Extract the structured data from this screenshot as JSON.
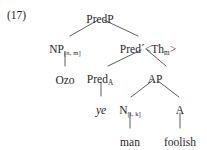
{
  "figure": {
    "example_number": "(17)",
    "type": "syntax-tree",
    "background_color": "#ffffff",
    "text_color": "#1f1f1f",
    "line_color": "#4a4a4a"
  },
  "nodes": {
    "root": {
      "label": "PredP",
      "x": 100,
      "y": 14
    },
    "np": {
      "label": "NP",
      "subscript": "[n, m]",
      "x": 65,
      "y": 44
    },
    "predbar": {
      "label": "Pred´",
      "annotation_open": "<Th",
      "annotation_subscript": "m",
      "annotation_close": ">",
      "x": 148,
      "y": 44
    },
    "pred_a": {
      "label": "Pred",
      "subscript": "A",
      "x": 100,
      "y": 74
    },
    "ap": {
      "label": "AP",
      "x": 155,
      "y": 74
    },
    "n": {
      "label": "N",
      "subscript": "[i, k]",
      "x": 130,
      "y": 105
    },
    "a": {
      "label": "A",
      "x": 180,
      "y": 105
    }
  },
  "terminals": {
    "ozo": {
      "text": "Ozo",
      "x": 65,
      "y": 75,
      "italic": false
    },
    "ye": {
      "text": "ye",
      "x": 101,
      "y": 105,
      "italic": true
    },
    "man": {
      "text": "man",
      "x": 130,
      "y": 137,
      "italic": false
    },
    "foolish": {
      "text": "foolish",
      "x": 180,
      "y": 137,
      "italic": false
    }
  },
  "edges": [
    {
      "from": "root",
      "to": "np"
    },
    {
      "from": "root",
      "to": "predbar"
    },
    {
      "from": "np",
      "to": "ozo"
    },
    {
      "from": "predbar",
      "to": "pred_a"
    },
    {
      "from": "predbar",
      "to": "ap"
    },
    {
      "from": "pred_a",
      "to": "ye"
    },
    {
      "from": "ap",
      "to": "n"
    },
    {
      "from": "ap",
      "to": "a"
    },
    {
      "from": "n",
      "to": "man"
    },
    {
      "from": "a",
      "to": "foolish"
    }
  ]
}
